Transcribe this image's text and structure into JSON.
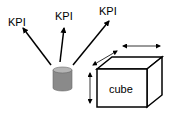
{
  "diagram": {
    "kpi_labels": [
      "KPI",
      "KPI",
      "KPI"
    ],
    "cube_label": "cube",
    "colors": {
      "cylinder_fill": "#8a8a8a",
      "cylinder_top": "#b5b5b5",
      "stroke": "#000000"
    }
  }
}
